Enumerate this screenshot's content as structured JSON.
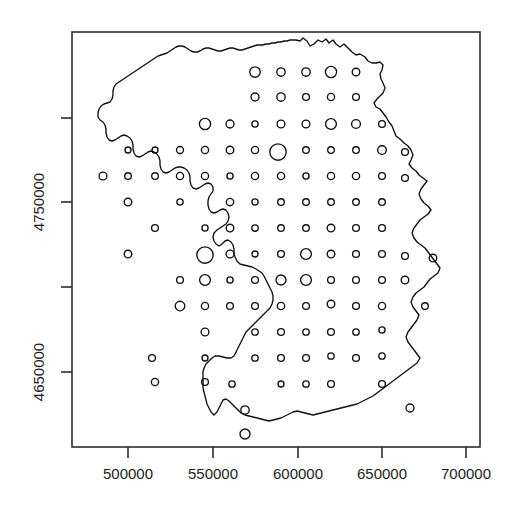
{
  "figure": {
    "type": "map-bubble-plot",
    "background": "#ffffff",
    "foreground": "#101010",
    "plot_box": {
      "x0": 72,
      "y0": 32,
      "x1": 480,
      "y1": 447
    }
  },
  "axes": {
    "x": {
      "label": "",
      "tick_labels": [
        "500000",
        "550000",
        "600000",
        "650000",
        "700000"
      ],
      "tick_values": [
        500000,
        550000,
        600000,
        650000,
        700000
      ],
      "tick_pixels": [
        128,
        213,
        298,
        382,
        466
      ],
      "range": [
        472500,
        707500
      ]
    },
    "y": {
      "label": "",
      "tick_labels": [
        "",
        "4750000",
        "",
        "4650000"
      ],
      "tick_values": [
        4800000,
        4750000,
        4700000,
        4650000
      ],
      "tick_pixels": [
        118,
        202,
        287,
        372
      ],
      "labeled": [
        {
          "text": "4750000",
          "value": 4750000,
          "pixel": 202
        },
        {
          "text": "4650000",
          "value": 4650000,
          "pixel": 372
        }
      ],
      "range": [
        4605000,
        4850000
      ]
    }
  },
  "chart_data": {
    "type": "scatter",
    "title": "",
    "xlabel": "",
    "ylabel": "",
    "xlim": [
      472500,
      707500
    ],
    "ylim": [
      4605000,
      4850000
    ],
    "grid": false,
    "legend": null,
    "series": [
      {
        "name": "sampling-grid-bubbles",
        "marker": "open-circle",
        "points": [
          {
            "x": 255,
            "y": 72,
            "r": 5.2
          },
          {
            "x": 281,
            "y": 72,
            "r": 4.2
          },
          {
            "x": 306,
            "y": 72,
            "r": 4.2
          },
          {
            "x": 331,
            "y": 72,
            "r": 5.6
          },
          {
            "x": 356,
            "y": 72,
            "r": 3.8
          },
          {
            "x": 255,
            "y": 97,
            "r": 4.0
          },
          {
            "x": 281,
            "y": 97,
            "r": 4.2
          },
          {
            "x": 306,
            "y": 97,
            "r": 3.4
          },
          {
            "x": 331,
            "y": 97,
            "r": 3.6
          },
          {
            "x": 356,
            "y": 97,
            "r": 3.4
          },
          {
            "x": 205,
            "y": 124,
            "r": 5.6
          },
          {
            "x": 230,
            "y": 124,
            "r": 4.0
          },
          {
            "x": 255,
            "y": 124,
            "r": 3.1
          },
          {
            "x": 281,
            "y": 124,
            "r": 3.9
          },
          {
            "x": 306,
            "y": 124,
            "r": 3.9
          },
          {
            "x": 331,
            "y": 124,
            "r": 5.4
          },
          {
            "x": 356,
            "y": 124,
            "r": 4.4
          },
          {
            "x": 382,
            "y": 124,
            "r": 3.4
          },
          {
            "x": 128,
            "y": 150,
            "r": 3.0
          },
          {
            "x": 155,
            "y": 150,
            "r": 3.0
          },
          {
            "x": 180,
            "y": 150,
            "r": 3.5
          },
          {
            "x": 205,
            "y": 150,
            "r": 3.6
          },
          {
            "x": 230,
            "y": 150,
            "r": 3.8
          },
          {
            "x": 255,
            "y": 150,
            "r": 3.6
          },
          {
            "x": 278,
            "y": 152,
            "r": 8.2
          },
          {
            "x": 306,
            "y": 150,
            "r": 3.3
          },
          {
            "x": 331,
            "y": 150,
            "r": 3.3
          },
          {
            "x": 356,
            "y": 150,
            "r": 3.3
          },
          {
            "x": 382,
            "y": 150,
            "r": 4.3
          },
          {
            "x": 405,
            "y": 152,
            "r": 3.4
          },
          {
            "x": 103,
            "y": 176,
            "r": 3.9
          },
          {
            "x": 128,
            "y": 176,
            "r": 3.3
          },
          {
            "x": 155,
            "y": 176,
            "r": 3.3
          },
          {
            "x": 180,
            "y": 176,
            "r": 3.6
          },
          {
            "x": 205,
            "y": 176,
            "r": 3.6
          },
          {
            "x": 230,
            "y": 176,
            "r": 3.1
          },
          {
            "x": 255,
            "y": 176,
            "r": 3.6
          },
          {
            "x": 281,
            "y": 176,
            "r": 3.6
          },
          {
            "x": 306,
            "y": 176,
            "r": 3.1
          },
          {
            "x": 331,
            "y": 176,
            "r": 3.6
          },
          {
            "x": 356,
            "y": 176,
            "r": 3.6
          },
          {
            "x": 382,
            "y": 176,
            "r": 3.4
          },
          {
            "x": 405,
            "y": 178,
            "r": 3.4
          },
          {
            "x": 128,
            "y": 202,
            "r": 3.8
          },
          {
            "x": 180,
            "y": 202,
            "r": 3.1
          },
          {
            "x": 230,
            "y": 202,
            "r": 3.7
          },
          {
            "x": 255,
            "y": 202,
            "r": 3.1
          },
          {
            "x": 281,
            "y": 202,
            "r": 3.3
          },
          {
            "x": 306,
            "y": 202,
            "r": 3.3
          },
          {
            "x": 331,
            "y": 202,
            "r": 3.3
          },
          {
            "x": 356,
            "y": 202,
            "r": 3.3
          },
          {
            "x": 382,
            "y": 202,
            "r": 3.3
          },
          {
            "x": 155,
            "y": 228,
            "r": 3.4
          },
          {
            "x": 205,
            "y": 228,
            "r": 3.1
          },
          {
            "x": 230,
            "y": 228,
            "r": 3.8
          },
          {
            "x": 255,
            "y": 228,
            "r": 3.2
          },
          {
            "x": 281,
            "y": 228,
            "r": 3.3
          },
          {
            "x": 306,
            "y": 228,
            "r": 3.3
          },
          {
            "x": 331,
            "y": 228,
            "r": 3.8
          },
          {
            "x": 356,
            "y": 228,
            "r": 3.4
          },
          {
            "x": 382,
            "y": 228,
            "r": 3.4
          },
          {
            "x": 128,
            "y": 254,
            "r": 3.8
          },
          {
            "x": 205,
            "y": 255,
            "r": 8.2
          },
          {
            "x": 230,
            "y": 254,
            "r": 3.9
          },
          {
            "x": 255,
            "y": 254,
            "r": 3.0
          },
          {
            "x": 281,
            "y": 254,
            "r": 3.4
          },
          {
            "x": 306,
            "y": 254,
            "r": 5.4
          },
          {
            "x": 331,
            "y": 254,
            "r": 3.8
          },
          {
            "x": 356,
            "y": 254,
            "r": 3.4
          },
          {
            "x": 382,
            "y": 254,
            "r": 3.4
          },
          {
            "x": 405,
            "y": 256,
            "r": 3.4
          },
          {
            "x": 433,
            "y": 258,
            "r": 3.8
          },
          {
            "x": 180,
            "y": 280,
            "r": 3.4
          },
          {
            "x": 205,
            "y": 280,
            "r": 5.4
          },
          {
            "x": 230,
            "y": 280,
            "r": 3.1
          },
          {
            "x": 255,
            "y": 280,
            "r": 3.4
          },
          {
            "x": 281,
            "y": 280,
            "r": 5.0
          },
          {
            "x": 306,
            "y": 280,
            "r": 5.4
          },
          {
            "x": 331,
            "y": 280,
            "r": 3.4
          },
          {
            "x": 356,
            "y": 280,
            "r": 3.4
          },
          {
            "x": 382,
            "y": 280,
            "r": 3.4
          },
          {
            "x": 405,
            "y": 280,
            "r": 3.8
          },
          {
            "x": 180,
            "y": 306,
            "r": 4.8
          },
          {
            "x": 205,
            "y": 306,
            "r": 3.6
          },
          {
            "x": 230,
            "y": 306,
            "r": 3.4
          },
          {
            "x": 255,
            "y": 306,
            "r": 3.4
          },
          {
            "x": 281,
            "y": 306,
            "r": 3.7
          },
          {
            "x": 306,
            "y": 306,
            "r": 3.4
          },
          {
            "x": 331,
            "y": 304,
            "r": 3.8
          },
          {
            "x": 356,
            "y": 306,
            "r": 3.4
          },
          {
            "x": 382,
            "y": 306,
            "r": 3.6
          },
          {
            "x": 425,
            "y": 306,
            "r": 3.3
          },
          {
            "x": 205,
            "y": 332,
            "r": 3.9
          },
          {
            "x": 255,
            "y": 332,
            "r": 3.2
          },
          {
            "x": 281,
            "y": 332,
            "r": 3.4
          },
          {
            "x": 306,
            "y": 332,
            "r": 3.2
          },
          {
            "x": 331,
            "y": 332,
            "r": 3.4
          },
          {
            "x": 356,
            "y": 332,
            "r": 3.2
          },
          {
            "x": 382,
            "y": 330,
            "r": 3.1
          },
          {
            "x": 152,
            "y": 358,
            "r": 3.4
          },
          {
            "x": 205,
            "y": 358,
            "r": 3.0
          },
          {
            "x": 255,
            "y": 358,
            "r": 3.2
          },
          {
            "x": 281,
            "y": 358,
            "r": 3.4
          },
          {
            "x": 306,
            "y": 358,
            "r": 3.4
          },
          {
            "x": 331,
            "y": 356,
            "r": 3.2
          },
          {
            "x": 356,
            "y": 358,
            "r": 3.4
          },
          {
            "x": 382,
            "y": 356,
            "r": 3.2
          },
          {
            "x": 155,
            "y": 382,
            "r": 3.6
          },
          {
            "x": 205,
            "y": 382,
            "r": 3.4
          },
          {
            "x": 232,
            "y": 384,
            "r": 3.2
          },
          {
            "x": 281,
            "y": 384,
            "r": 3.0
          },
          {
            "x": 306,
            "y": 384,
            "r": 3.2
          },
          {
            "x": 331,
            "y": 384,
            "r": 3.4
          },
          {
            "x": 382,
            "y": 384,
            "r": 3.4
          },
          {
            "x": 245,
            "y": 410,
            "r": 4.2
          },
          {
            "x": 410,
            "y": 408,
            "r": 4.0
          },
          {
            "x": 245,
            "y": 434,
            "r": 5.0
          }
        ]
      }
    ]
  }
}
